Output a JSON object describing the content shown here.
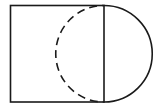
{
  "diagram": {
    "colors": {
      "stroke": "#1a1a1a",
      "background": "#ffffff"
    },
    "square": {
      "x": 10.5,
      "y": 5.5,
      "width": 93.5,
      "height": 96.5
    },
    "semicircle_solid": {
      "cx": 104,
      "cy": 53.75,
      "r": 48.25,
      "side": "right",
      "style": "solid"
    },
    "semicircle_dashed": {
      "cx": 104,
      "cy": 53.75,
      "r": 48.25,
      "side": "left",
      "style": "dashed"
    }
  }
}
